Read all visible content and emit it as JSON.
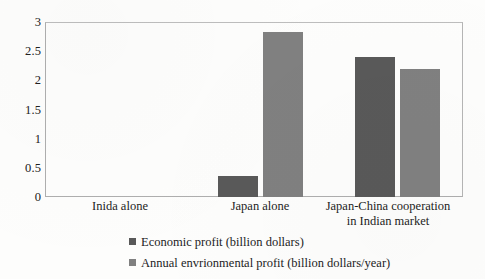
{
  "chart_data": {
    "type": "bar",
    "title": "",
    "xlabel": "",
    "ylabel": "",
    "ylim": [
      0,
      3
    ],
    "yticks": [
      "0",
      "0.5",
      "1",
      "1.5",
      "2",
      "2.5",
      "3"
    ],
    "grid": false,
    "legend_position": "bottom",
    "categories": [
      "Inida alone",
      "Japan alone",
      "Japan-China cooperation in Indian market"
    ],
    "category_lines": [
      [
        "Inida alone"
      ],
      [
        "Japan alone"
      ],
      [
        "Japan-China cooperation",
        "in Indian market"
      ]
    ],
    "series": [
      {
        "name": "Economic profit (billion dollars)",
        "color": "#595959",
        "values": [
          0,
          0.36,
          2.42
        ]
      },
      {
        "name": "Annual envrionmental profit (billion dollars/year)",
        "color": "#808080",
        "values": [
          0,
          2.85,
          2.21
        ]
      }
    ]
  },
  "legend": {
    "items": [
      {
        "label": "Economic profit (billion dollars)",
        "color": "#595959"
      },
      {
        "label": "Annual envrionmental profit (billion dollars/year)",
        "color": "#808080"
      }
    ]
  },
  "axis": {
    "y_tick_0": "0",
    "y_tick_1": "0.5",
    "y_tick_2": "1",
    "y_tick_3": "1.5",
    "y_tick_4": "2",
    "y_tick_5": "2.5",
    "y_tick_6": "3"
  }
}
